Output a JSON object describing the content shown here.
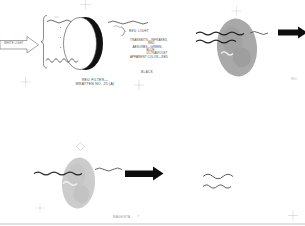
{
  "figure": {
    "top_left_diagram": {
      "white_light_label": "WHITE LIGHT",
      "red_light_label": "RED LIGHT",
      "properties": [
        "TRANSMITS—INFRARED,",
        "RED",
        "ABSORBS—GREEN,",
        "BLUE,",
        "ULTRAVIOLET",
        "APPARENT COLOR—RED"
      ],
      "black_label": "BLACK",
      "caption_line1": "RED FILTER—",
      "caption_line2": "WRATTEN NO. 25 (A)"
    },
    "top_right_diagram": {
      "edge_label": "RED"
    },
    "bottom_left_diagram": {
      "caption": "MAGENTA",
      "chevron": "›"
    },
    "colors": {
      "background": "#ffffff",
      "line_art": "#3a3a3a",
      "arrow_black": "#0d0d0d",
      "filter_gray_dark": "#a9a9a9",
      "filter_gray_light": "#cccccc",
      "registration_mark": "#c4c4c4"
    }
  }
}
